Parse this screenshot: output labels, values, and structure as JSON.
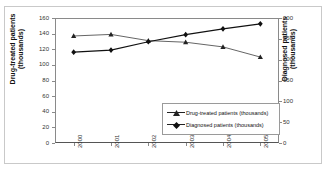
{
  "top_remnant_text": "",
  "chart_data": {
    "type": "line",
    "title": "",
    "xlabel": "",
    "categories": [
      "2000",
      "2001",
      "2002",
      "2003",
      "2004",
      "2005"
    ],
    "grid": false,
    "legend_position": "inside-lower-right",
    "axes": {
      "left": {
        "label": "Drug-treated patients (thousands)",
        "ticks": [
          "0",
          "20",
          "40",
          "60",
          "80",
          "100",
          "120",
          "140",
          "160"
        ],
        "tick_values": [
          0,
          20,
          40,
          60,
          80,
          100,
          120,
          140,
          160
        ],
        "ylim": [
          0,
          160
        ]
      },
      "right": {
        "label": "Diagnosed patients (thousands)",
        "ticks": [
          "0",
          "50",
          "100",
          "150",
          "200",
          "250",
          "300"
        ],
        "tick_values": [
          0,
          50,
          100,
          150,
          200,
          250,
          300
        ],
        "ylim": [
          0,
          300
        ]
      }
    },
    "series": [
      {
        "name": "Drug-treated patients (thousands)",
        "axis": "left",
        "marker": "triangle",
        "color": "#222222",
        "values": [
          137,
          139,
          131,
          129,
          123,
          110
        ]
      },
      {
        "name": "Diagnosed patients (thousands)",
        "axis": "right",
        "marker": "diamond",
        "color": "#111111",
        "values": [
          218,
          223,
          243,
          260,
          274,
          286
        ]
      }
    ]
  },
  "legend": {
    "items": [
      {
        "label": "Drug-treated patients (thousands)",
        "marker": "triangle"
      },
      {
        "label": "Diagnosed patients (thousands)",
        "marker": "diamond"
      }
    ]
  }
}
